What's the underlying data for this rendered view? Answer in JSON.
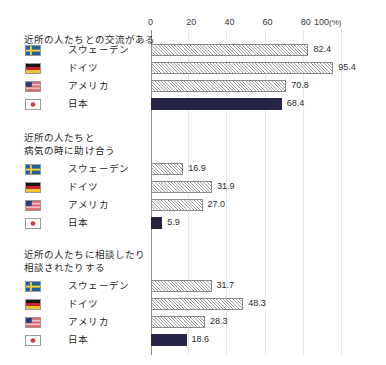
{
  "chart_data": {
    "type": "bar",
    "orientation": "horizontal",
    "title": "",
    "xlabel": "100(%)",
    "ylabel": "",
    "xlim": [
      0,
      100
    ],
    "xticks": [
      0,
      20,
      40,
      60,
      80,
      100
    ],
    "xtick_labels": [
      "0",
      "20",
      "40",
      "60",
      "80",
      "100"
    ],
    "x_unit_suffix": "(%)",
    "grid": true,
    "grid_axis": "x",
    "legend": "none",
    "categories": [
      "スウェーデン",
      "ドイツ",
      "アメリカ",
      "日本"
    ],
    "colors": {
      "hatched_bar_outline": "#8a8a8a",
      "hatched_bar_fill": "#ffffff",
      "highlight_bar": "#262444",
      "axis": "#8e8e94",
      "gridline": "#e9e9ec",
      "text": "#1f1f1f"
    },
    "panels": [
      {
        "title": "近所の人たちとの交流がある",
        "title_lines": [
          "近所の人たちとの交流がある"
        ],
        "categories": [
          "スウェーデン",
          "ドイツ",
          "アメリカ",
          "日本"
        ],
        "values": [
          82.4,
          95.4,
          70.8,
          68.4
        ],
        "value_labels": [
          "82.4",
          "95.4",
          "70.8",
          "68.4"
        ],
        "highlight_index": 3
      },
      {
        "title": "近所の人たちと病気の時に助け合う",
        "title_lines": [
          "近所の人たちと",
          "病気の時に助け合う"
        ],
        "categories": [
          "スウェーデン",
          "ドイツ",
          "アメリカ",
          "日本"
        ],
        "values": [
          16.9,
          31.9,
          27.0,
          5.9
        ],
        "value_labels": [
          "16.9",
          "31.9",
          "27.0",
          "5.9"
        ],
        "highlight_index": 3
      },
      {
        "title": "近所の人たちに相談したり相談されたりする",
        "title_lines": [
          "近所の人たちに相談したり",
          "相談されたりする"
        ],
        "categories": [
          "スウェーデン",
          "ドイツ",
          "アメリカ",
          "日本"
        ],
        "values": [
          31.7,
          48.3,
          28.3,
          18.6
        ],
        "value_labels": [
          "31.7",
          "48.3",
          "28.3",
          "18.6"
        ],
        "highlight_index": 3
      }
    ]
  },
  "axis": {
    "ticks": [
      {
        "label": "0",
        "value": 0
      },
      {
        "label": "20",
        "value": 20
      },
      {
        "label": "40",
        "value": 40
      },
      {
        "label": "60",
        "value": 60
      },
      {
        "label": "80",
        "value": 80
      },
      {
        "label": "100",
        "value": 100
      }
    ],
    "unit": "(%)"
  },
  "flags": {
    "スウェーデン": "sweden-flag-icon",
    "ドイツ": "germany-flag-icon",
    "アメリカ": "usa-flag-icon",
    "日本": "japan-flag-icon"
  }
}
